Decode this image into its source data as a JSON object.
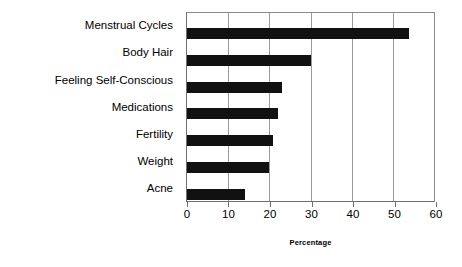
{
  "chart_data": {
    "type": "bar",
    "orientation": "horizontal",
    "title": "",
    "xlabel": "Percentage",
    "ylabel": "",
    "xlim": [
      0,
      60
    ],
    "xticks": [
      0,
      10,
      20,
      30,
      40,
      50,
      60
    ],
    "grid": true,
    "legend": false,
    "bar_color": "#111111",
    "categories": [
      "Menstrual Cycles",
      "Body Hair",
      "Feeling Self-Conscious",
      "Medications",
      "Fertility",
      "Weight",
      "Acne"
    ],
    "values": [
      54,
      30,
      23,
      22,
      21,
      20,
      14
    ]
  }
}
